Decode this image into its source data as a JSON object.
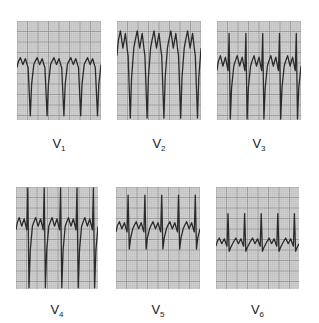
{
  "figure": {
    "grid_color": "#d6d6d6",
    "trace_color": "#2b2b2b"
  },
  "leads": [
    {
      "id": "V1",
      "label_main": "V",
      "label_sub": "1",
      "x": 17,
      "y": 21,
      "w": 84,
      "h": 99,
      "label_y": 137,
      "beats": 5,
      "baseline": 0.47,
      "r_height": 0.0,
      "s_depth": 0.92,
      "t_height": 0.1,
      "morphology": "rS with peaked positive deflections"
    },
    {
      "id": "V2",
      "label_main": "V",
      "label_sub": "2",
      "x": 117,
      "y": 21,
      "w": 84,
      "h": 99,
      "label_y": 137,
      "beats": 5,
      "baseline": 0.35,
      "r_height": 0.0,
      "s_depth": 0.97,
      "t_height": 0.25,
      "morphology": "deep S waves with tall T"
    },
    {
      "id": "V3",
      "label_main": "V",
      "label_sub": "3",
      "x": 217,
      "y": 21,
      "w": 84,
      "h": 99,
      "label_y": 137,
      "beats": 5,
      "baseline": 0.5,
      "r_height": 0.75,
      "s_depth": 0.98,
      "t_height": 0.15,
      "morphology": "RS transition"
    },
    {
      "id": "V4",
      "label_main": "V",
      "label_sub": "4",
      "x": 16,
      "y": 187,
      "w": 82,
      "h": 102,
      "label_y": 303,
      "beats": 5,
      "baseline": 0.42,
      "r_height": 0.98,
      "s_depth": 0.98,
      "t_height": 0.12,
      "morphology": "tall R and deep S"
    },
    {
      "id": "V5",
      "label_main": "V",
      "label_sub": "5",
      "x": 116,
      "y": 187,
      "w": 84,
      "h": 102,
      "label_y": 303,
      "beats": 5,
      "baseline": 0.44,
      "r_height": 0.82,
      "s_depth": 0.3,
      "t_height": 0.1,
      "morphology": "Rs with small T"
    },
    {
      "id": "V6",
      "label_main": "V",
      "label_sub": "6",
      "x": 216,
      "y": 187,
      "w": 83,
      "h": 102,
      "label_y": 303,
      "beats": 5,
      "baseline": 0.58,
      "r_height": 0.55,
      "s_depth": 0.12,
      "t_height": 0.08,
      "morphology": "Rs low amplitude"
    }
  ]
}
